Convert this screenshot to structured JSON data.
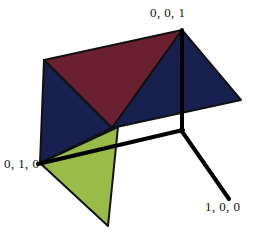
{
  "figure": {
    "background_color": "#ffffff",
    "width": 274,
    "height": 238
  },
  "labels": {
    "z_axis": "0, 0, 1",
    "y_axis": "0, 1, 0",
    "x_axis": "1, 0, 0"
  },
  "colors": {
    "maroon_face": "#6B2031",
    "navy_face": "#17204E",
    "green_face": "#9ABB47",
    "outline": "#111111",
    "axis": "#000000",
    "background": "#ffffff"
  },
  "geometry": {
    "origin": {
      "x": 182,
      "y": 130
    },
    "vertex_z": {
      "x": 182,
      "y": 30
    },
    "vertex_x_end": {
      "x": 229,
      "y": 198
    },
    "vertex_y_end": {
      "x": 38,
      "y": 164
    },
    "plane_top_left": {
      "x": 44,
      "y": 60
    },
    "plane_right": {
      "x": 241,
      "y": 100
    },
    "plane_center": {
      "x": 112,
      "y": 128
    },
    "plane_left_bottom": {
      "x": 40,
      "y": 163
    },
    "green_bottom": {
      "x": 108,
      "y": 226
    },
    "green_right": {
      "x": 118,
      "y": 127
    }
  },
  "faces": [
    {
      "name": "maroon-triangle",
      "color": "#6B2031",
      "points": "44,60 182,30 112,128"
    },
    {
      "name": "navy-upper-right-triangle",
      "color": "#17204E",
      "points": "182,30 241,100 112,128"
    },
    {
      "name": "navy-left-triangle",
      "color": "#17204E",
      "points": "44,60 112,128 40,163"
    },
    {
      "name": "green-triangle",
      "color": "#9ABB47",
      "points": "40,163 118,127 108,226"
    }
  ],
  "axes": [
    {
      "name": "z-axis",
      "from": "182,130",
      "to": "182,30"
    },
    {
      "name": "x-axis",
      "from": "182,130",
      "to": "229,198"
    },
    {
      "name": "y-axis",
      "from": "182,130",
      "to": "38,164"
    }
  ]
}
